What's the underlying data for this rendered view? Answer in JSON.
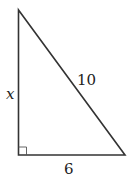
{
  "diagram": {
    "type": "right-triangle",
    "stroke_color": "#333333",
    "labels": {
      "vertical_leg": "x",
      "hypotenuse": "10",
      "horizontal_leg": "6"
    },
    "right_angle_marker": true
  }
}
